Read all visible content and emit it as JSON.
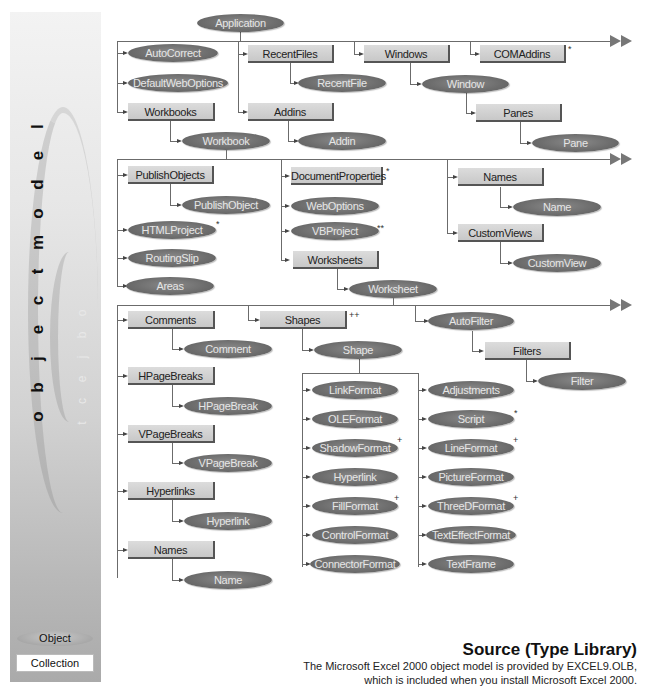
{
  "sidebar": {
    "title_letters": [
      "l",
      "e",
      "d",
      "o",
      "m",
      " ",
      "t",
      "c",
      "e",
      "j",
      "b",
      "o"
    ],
    "title": "object model",
    "ghost_letters": [
      "o",
      "b",
      "j",
      "e",
      "c",
      "t",
      " ",
      "m",
      "o",
      "d",
      "e",
      "l"
    ],
    "legend": {
      "object_label": "Object",
      "collection_label": "Collection"
    }
  },
  "nodes": {
    "application": "Application",
    "autocorrect": "AutoCorrect",
    "defaultweboptions": "DefaultWebOptions",
    "workbooks": "Workbooks",
    "workbook": "Workbook",
    "recentfiles": "RecentFiles",
    "recentfile": "RecentFile",
    "addins": "Addins",
    "addin": "Addin",
    "windows": "Windows",
    "window": "Window",
    "panes": "Panes",
    "pane": "Pane",
    "comaddins": "COMAddins",
    "publishobjects": "PublishObjects",
    "publishobject": "PublishObject",
    "htmlproject": "HTMLProject",
    "routingslip": "RoutingSlip",
    "areas": "Areas",
    "documentproperties": "DocumentProperties",
    "weboptions": "WebOptions",
    "vbproject": "VBProject",
    "worksheets": "Worksheets",
    "worksheet": "Worksheet",
    "names_wb": "Names",
    "name_wb": "Name",
    "customviews": "CustomViews",
    "customview": "CustomView",
    "comments": "Comments",
    "comment": "Comment",
    "hpagebreaks": "HPageBreaks",
    "hpagebreak": "HPageBreak",
    "vpagebreaks": "VPageBreaks",
    "vpagebreak": "VPageBreak",
    "hyperlinks": "Hyperlinks",
    "hyperlink_ws": "Hyperlink",
    "names_ws": "Names",
    "name_ws": "Name",
    "shapes": "Shapes",
    "shape": "Shape",
    "linkformat": "LinkFormat",
    "oleformat": "OLEFormat",
    "shadowformat": "ShadowFormat",
    "hyperlink_sh": "Hyperlink",
    "fillformat": "FillFormat",
    "controlformat": "ControlFormat",
    "connectorformat": "ConnectorFormat",
    "adjustments": "Adjustments",
    "script": "Script",
    "lineformat": "LineFormat",
    "pictureformat": "PictureFormat",
    "threedformat": "ThreeDFormat",
    "texteffectformat": "TextEffectFormat",
    "textframe": "TextFrame",
    "autofilter": "AutoFilter",
    "filters": "Filters",
    "filter": "Filter"
  },
  "marks": {
    "comaddins": "*",
    "htmlproject": "*",
    "documentproperties": "*",
    "vbproject": "**",
    "shapes": "++",
    "shadowformat": "+",
    "fillformat": "+",
    "script": "*",
    "lineformat": "+",
    "threedformat": "+"
  },
  "source": {
    "title": "Source (Type Library)",
    "line1": "The Microsoft Excel 2000 object model is provided by EXCEL9.OLB,",
    "line2": "which is included when you install Microsoft Excel 2000."
  }
}
